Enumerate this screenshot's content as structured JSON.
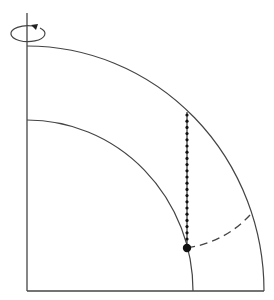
{
  "diagram": {
    "rotation_indicator": "rotation-arrow-around-axis",
    "colors": {
      "line": "#444444",
      "dot": "#111111",
      "background": "#ffffff"
    },
    "elements": [
      "rotation-axis",
      "rotation-arrow",
      "outer-shell-arc",
      "inner-shell-arc",
      "equatorial-base-line",
      "plumb-line-dotted",
      "point-on-inner-surface",
      "dashed-curve"
    ]
  }
}
